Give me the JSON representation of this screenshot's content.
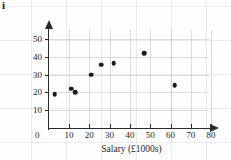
{
  "part_label": "i",
  "chart_data": {
    "type": "scatter",
    "title": "",
    "xlabel": "Salary (£1000s)",
    "ylabel": "Hours worked per week",
    "xlim": [
      0,
      85
    ],
    "ylim": [
      0,
      57
    ],
    "xticks": [
      10,
      20,
      30,
      40,
      50,
      60,
      70,
      80
    ],
    "yticks": [
      10,
      20,
      30,
      40,
      50
    ],
    "origin_label": "0",
    "grid": true,
    "legend": null,
    "marker": {
      "shape": "circle",
      "color": "#1a1a1a",
      "size": 4.6
    },
    "points": [
      {
        "x": 3,
        "y": 19
      },
      {
        "x": 11,
        "y": 22
      },
      {
        "x": 13,
        "y": 20
      },
      {
        "x": 21,
        "y": 30
      },
      {
        "x": 26,
        "y": 35.5
      },
      {
        "x": 32,
        "y": 36.5
      },
      {
        "x": 47,
        "y": 42
      },
      {
        "x": 62,
        "y": 24
      }
    ]
  },
  "colors": {
    "axis": "#2a2a2a",
    "marker": "#1a1a1a",
    "grid": "#afb4be",
    "background": "#fefefe"
  }
}
